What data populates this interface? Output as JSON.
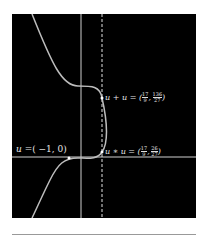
{
  "figure": {
    "background": "#000000",
    "axis_color": "#cfcfcf",
    "curve_color": "#bdbdbd",
    "dashed_line": "x = 17/9",
    "labels": {
      "u": {
        "text_prefix": "u =",
        "value": "( −1, 0)"
      },
      "u_plus_u": {
        "text_prefix": "u + u = (",
        "x_num": "17",
        "x_den": "9",
        "y_num": "136",
        "y_den": "27",
        "suffix": ")"
      },
      "u_star_u": {
        "text_prefix": "u ∗ u = (",
        "x_num": "17",
        "x_den": "9",
        "y_num": "26",
        "y_den": "27",
        "suffix": ")"
      }
    }
  }
}
